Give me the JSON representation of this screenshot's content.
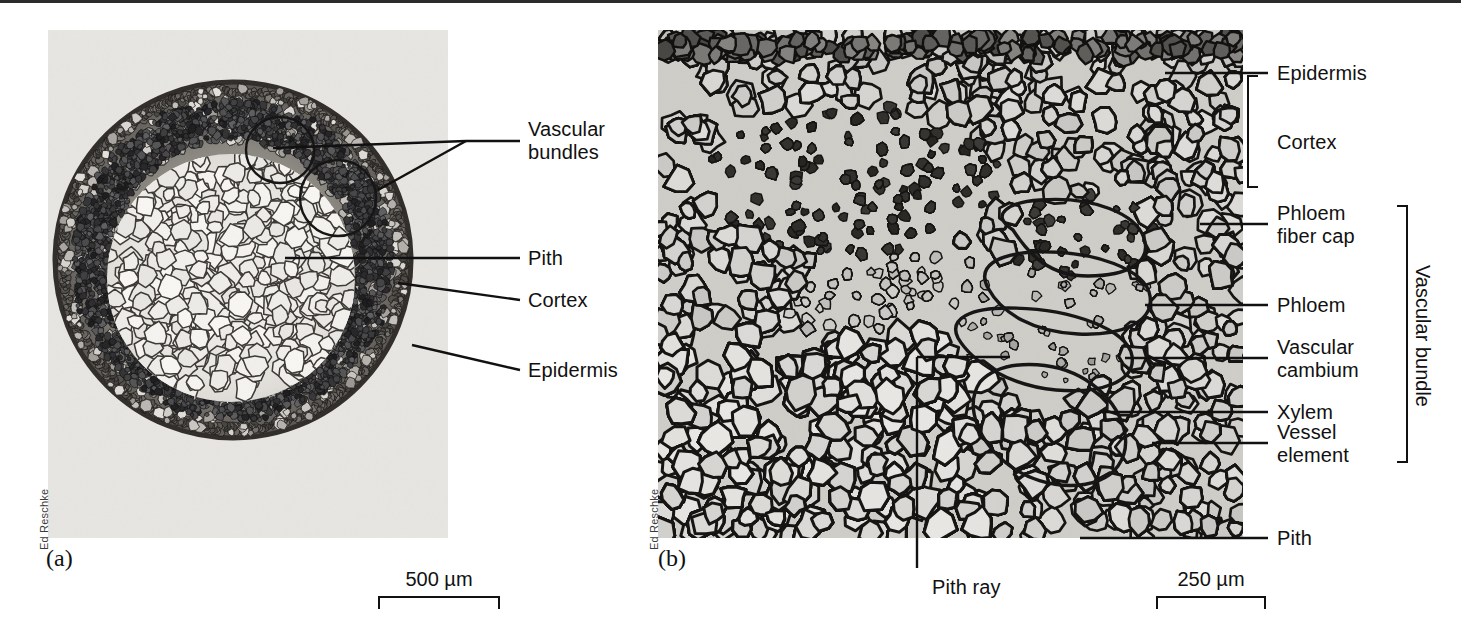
{
  "figure": {
    "background_color": "#ffffff",
    "line_color": "#111111",
    "top_rule_color": "#2b2b2b"
  },
  "panel_a": {
    "letter": "(a)",
    "credit": "Ed Reschke",
    "scale_bar": {
      "value": "500 µm",
      "length_px": 122
    },
    "labels": [
      {
        "id": "vascular-bundles",
        "text": "Vascular\nbundles"
      },
      {
        "id": "pith",
        "text": "Pith"
      },
      {
        "id": "cortex",
        "text": "Cortex"
      },
      {
        "id": "epidermis",
        "text": "Epidermis"
      }
    ]
  },
  "panel_b": {
    "letter": "(b)",
    "credit": "Ed Reschke",
    "scale_bar": {
      "value": "250 µm",
      "length_px": 110
    },
    "labels": [
      {
        "id": "epidermis",
        "text": "Epidermis"
      },
      {
        "id": "cortex",
        "text": "Cortex"
      },
      {
        "id": "phloem-fiber-cap",
        "text": "Phloem\nfiber cap"
      },
      {
        "id": "phloem",
        "text": "Phloem"
      },
      {
        "id": "vascular-cambium",
        "text": "Vascular\ncambium"
      },
      {
        "id": "xylem",
        "text": "Xylem"
      },
      {
        "id": "vessel-element",
        "text": "Vessel\nelement"
      },
      {
        "id": "pith",
        "text": "Pith"
      },
      {
        "id": "pith-ray",
        "text": "Pith ray"
      }
    ],
    "brackets": [
      {
        "id": "cortex-bracket",
        "spans": [
          "Epidermis",
          "Cortex"
        ]
      },
      {
        "id": "vascular-bundle-bracket",
        "label": "Vascular bundle"
      }
    ]
  }
}
